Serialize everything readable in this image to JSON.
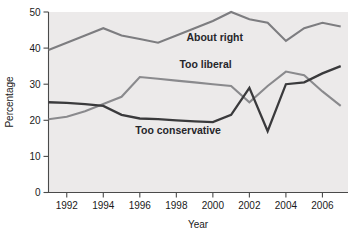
{
  "chart_data": {
    "type": "line",
    "title": "",
    "xlabel": "Year",
    "ylabel": "Percentage",
    "xlim": [
      1991,
      2007.4
    ],
    "ylim": [
      0,
      50
    ],
    "grid": false,
    "legend_position": "inline-labels",
    "x_ticks": [
      1992,
      1994,
      1996,
      1998,
      2000,
      2002,
      2004,
      2006
    ],
    "x_tick_labels": [
      "1992",
      "1994",
      "1996",
      "1998",
      "2000",
      "2002",
      "2004",
      "2006"
    ],
    "y_ticks": [
      0,
      10,
      20,
      30,
      40,
      50
    ],
    "y_tick_labels": [
      "0",
      "10",
      "20",
      "30",
      "40",
      "50"
    ],
    "x": [
      1991,
      1992,
      1993,
      1994,
      1995,
      1996,
      1997,
      1998,
      1999,
      2000,
      2001,
      2002,
      2003,
      2004,
      2005,
      2006,
      2007
    ],
    "series": [
      {
        "name": "About right",
        "color": "#7d7d80",
        "width": 2.1,
        "label_x": 2000.1,
        "label_y": 42.0,
        "values": [
          39.5,
          41.5,
          43.5,
          45.5,
          43.5,
          42.5,
          41.5,
          43.5,
          45.5,
          47.5,
          50.0,
          48.0,
          47.0,
          42.0,
          45.5,
          47.0,
          46.0
        ]
      },
      {
        "name": "Too liberal",
        "color": "#8a8a8d",
        "width": 2.1,
        "label_x": 1999.6,
        "label_y": 34.5,
        "values": [
          20.3,
          21.0,
          22.5,
          24.5,
          26.5,
          32.0,
          31.5,
          31.0,
          30.5,
          30.0,
          29.5,
          25.0,
          29.5,
          33.5,
          32.5,
          28.0,
          24.0
        ]
      },
      {
        "name": "Too conservative",
        "color": "#3a3a3c",
        "width": 2.3,
        "label_x": 1998.1,
        "label_y": 16.2,
        "values": [
          25.0,
          24.8,
          24.5,
          24.0,
          21.5,
          20.5,
          20.3,
          20.0,
          19.7,
          19.5,
          21.5,
          29.0,
          17.0,
          30.0,
          30.5,
          33.0,
          35.0
        ]
      }
    ],
    "annotations": [
      {
        "text": "About right",
        "x": 2000.1,
        "y": 42.0
      },
      {
        "text": "Too liberal",
        "x": 1999.6,
        "y": 34.5
      },
      {
        "text": "Too conservative",
        "x": 1998.1,
        "y": 16.2
      }
    ]
  }
}
